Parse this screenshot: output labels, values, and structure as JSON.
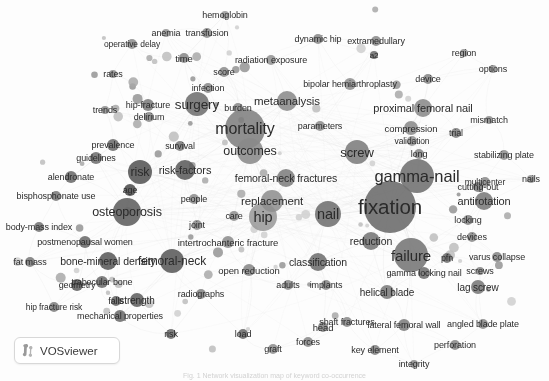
{
  "app": {
    "name": "VOSviewer",
    "logo_label": "VOSviewer",
    "logo_icon": "vosviewer-mark-icon",
    "view_type": "network-visualization",
    "background_color": "#fdfdfd",
    "node_color": "#6e6e6e",
    "link_color": "#c9c9c9",
    "label_color": "#2b2b2b",
    "canvas_width": 549,
    "canvas_height": 381
  },
  "caption": {
    "text": "Fig. 1 Network visualization map of keyword co-occurrence"
  },
  "chart_data": {
    "type": "scatter",
    "subtitle": "VOSviewer network visualization, grayscale",
    "xlabel": "",
    "ylabel": "",
    "legend": "none",
    "grid": false,
    "xlim": [
      0,
      549
    ],
    "ylim": [
      0,
      381
    ],
    "encoding": {
      "x": "map x position (px)",
      "y": "map y position (px)",
      "size": "node weight / occurrences (radius px)",
      "fontsize": "label weight (px)"
    },
    "nodes": [
      {
        "label": "fixation",
        "x": 390,
        "y": 207,
        "r": 26,
        "font": 20.5,
        "shade": "#6a6a6a"
      },
      {
        "label": "gamma-nail",
        "x": 417,
        "y": 176,
        "r": 17,
        "font": 16.5,
        "shade": "#6f6f6f"
      },
      {
        "label": "mortality",
        "x": 245,
        "y": 129,
        "r": 20,
        "font": 16,
        "shade": "#808080"
      },
      {
        "label": "failure",
        "x": 411,
        "y": 255,
        "r": 17,
        "font": 15,
        "shade": "#757575"
      },
      {
        "label": "nail",
        "x": 328,
        "y": 214,
        "r": 13,
        "font": 14.5,
        "shade": "#6f6f6f"
      },
      {
        "label": "hip",
        "x": 263,
        "y": 217,
        "r": 14,
        "font": 14.5,
        "shade": "#9a9a9a"
      },
      {
        "label": "surgery",
        "x": 197,
        "y": 104,
        "r": 12,
        "font": 13.5,
        "shade": "#707070"
      },
      {
        "label": "screw",
        "x": 357,
        "y": 152,
        "r": 12,
        "font": 13,
        "shade": "#7c7c7c"
      },
      {
        "label": "outcomes",
        "x": 250,
        "y": 151,
        "r": 13,
        "font": 12.5,
        "shade": "#8a8a8a"
      },
      {
        "label": "osteoporosis",
        "x": 127,
        "y": 212,
        "r": 14,
        "font": 12.5,
        "shade": "#5e5e5e"
      },
      {
        "label": "risk",
        "x": 140,
        "y": 172,
        "r": 12,
        "font": 12.5,
        "shade": "#555555"
      },
      {
        "label": "femoral-neck",
        "x": 172,
        "y": 261,
        "r": 12,
        "font": 12,
        "shade": "#5a5a5a"
      },
      {
        "label": "replacement",
        "x": 272,
        "y": 201,
        "r": 11,
        "font": 11.5,
        "shade": "#8f8f8f"
      },
      {
        "label": "metaanalysis",
        "x": 287,
        "y": 101,
        "r": 10,
        "font": 11.5,
        "shade": "#8b8b8b"
      },
      {
        "label": "antirotation",
        "x": 484,
        "y": 201,
        "r": 9,
        "font": 11,
        "shade": "#7a7a7a"
      },
      {
        "label": "risk-factors",
        "x": 185,
        "y": 170,
        "r": 10,
        "font": 11,
        "shade": "#5c5c5c"
      },
      {
        "label": "proximal femoral nail",
        "x": 423,
        "y": 108,
        "r": 9,
        "font": 11,
        "shade": "#8a8a8a"
      },
      {
        "label": "femoral-neck fractures",
        "x": 286,
        "y": 178,
        "r": 9,
        "font": 10.5,
        "shade": "#7e7e7e"
      },
      {
        "label": "reduction",
        "x": 371,
        "y": 241,
        "r": 9,
        "font": 10.5,
        "shade": "#757575"
      },
      {
        "label": "classification",
        "x": 318,
        "y": 262,
        "r": 9,
        "font": 10.5,
        "shade": "#6e6e6e"
      },
      {
        "label": "bone-mineral density",
        "x": 108,
        "y": 261,
        "r": 9,
        "font": 10.5,
        "shade": "#5a5a5a"
      },
      {
        "label": "lag screw",
        "x": 478,
        "y": 287,
        "r": 7,
        "font": 10,
        "shade": "#777777"
      },
      {
        "label": "helical blade",
        "x": 387,
        "y": 292,
        "r": 7,
        "font": 10,
        "shade": "#7b7b7b"
      },
      {
        "label": "strength",
        "x": 137,
        "y": 300,
        "r": 7,
        "font": 10,
        "shade": "#606060"
      },
      {
        "label": "compression",
        "x": 411,
        "y": 128,
        "r": 7,
        "font": 9.5,
        "shade": "#8b8b8b"
      },
      {
        "label": "open reduction",
        "x": 249,
        "y": 270,
        "r": 6,
        "font": 9.5,
        "shade": "#888888"
      },
      {
        "label": "intertrochanteric fracture",
        "x": 228,
        "y": 242,
        "r": 6,
        "font": 9.5,
        "shade": "#8d8d8d"
      },
      {
        "label": "gamma locking nail",
        "x": 424,
        "y": 273,
        "r": 6,
        "font": 9,
        "shade": "#6f6f6f"
      },
      {
        "label": "lateral femoral wall",
        "x": 404,
        "y": 325,
        "r": 6,
        "font": 9,
        "shade": "#7d7d7d"
      },
      {
        "label": "angled blade plate",
        "x": 483,
        "y": 324,
        "r": 5,
        "font": 9,
        "shade": "#8c8c8c"
      },
      {
        "label": "trabecular bone",
        "x": 102,
        "y": 282,
        "r": 6,
        "font": 9,
        "shade": "#6d6d6d"
      },
      {
        "label": "postmenopausal women",
        "x": 85,
        "y": 242,
        "r": 6,
        "font": 9,
        "shade": "#6a6a6a"
      },
      {
        "label": "bipolar hemiarthroplasty",
        "x": 350,
        "y": 84,
        "r": 6,
        "font": 9,
        "shade": "#8f8f8f"
      },
      {
        "label": "mechanical properties",
        "x": 120,
        "y": 316,
        "r": 6,
        "font": 9,
        "shade": "#6c6c6c"
      },
      {
        "label": "stabilizing plate",
        "x": 504,
        "y": 155,
        "r": 5,
        "font": 9,
        "shade": "#909090"
      },
      {
        "label": "varus collapse",
        "x": 497,
        "y": 257,
        "r": 5,
        "font": 9,
        "shade": "#868686"
      },
      {
        "label": "hip-fracture",
        "x": 148,
        "y": 105,
        "r": 6,
        "font": 9,
        "shade": "#7c7c7c"
      },
      {
        "label": "bisphosphonate use",
        "x": 56,
        "y": 196,
        "r": 5,
        "font": 9,
        "shade": "#7a7a7a"
      },
      {
        "label": "radiation exposure",
        "x": 271,
        "y": 60,
        "r": 5,
        "font": 9,
        "shade": "#949494"
      },
      {
        "label": "extramedullary",
        "x": 376,
        "y": 41,
        "r": 5,
        "font": 9,
        "shade": "#8b8b8b"
      },
      {
        "label": "body-mass index",
        "x": 39,
        "y": 227,
        "r": 5,
        "font": 9,
        "shade": "#757575"
      },
      {
        "label": "hip fracture risk",
        "x": 54,
        "y": 307,
        "r": 5,
        "font": 8.5,
        "shade": "#7f7f7f"
      },
      {
        "label": "operative delay",
        "x": 132,
        "y": 44,
        "r": 5,
        "font": 8.5,
        "shade": "#8e8e8e"
      },
      {
        "label": "dynamic hip",
        "x": 318,
        "y": 39,
        "r": 5,
        "font": 9,
        "shade": "#8a8a8a"
      },
      {
        "label": "multicenter",
        "x": 485,
        "y": 182,
        "r": 5,
        "font": 8.5,
        "shade": "#8b8b8b"
      },
      {
        "label": "shaft fractures",
        "x": 347,
        "y": 322,
        "r": 5,
        "font": 9,
        "shade": "#8a8a8a"
      },
      {
        "label": "key element",
        "x": 375,
        "y": 350,
        "r": 5,
        "font": 9,
        "shade": "#828282"
      },
      {
        "label": "perforation",
        "x": 455,
        "y": 345,
        "r": 5,
        "font": 9,
        "shade": "#898989"
      },
      {
        "label": "prevalence",
        "x": 113,
        "y": 145,
        "r": 6,
        "font": 9,
        "shade": "#6b6b6b"
      },
      {
        "label": "alendronate",
        "x": 71,
        "y": 177,
        "r": 6,
        "font": 9,
        "shade": "#6a6a6a"
      },
      {
        "label": "guidelines",
        "x": 96,
        "y": 158,
        "r": 6,
        "font": 9,
        "shade": "#707070"
      },
      {
        "label": "transfusion",
        "x": 207,
        "y": 33,
        "r": 5,
        "font": 9,
        "shade": "#8c8c8c"
      },
      {
        "label": "hemoglobin",
        "x": 225,
        "y": 15,
        "r": 4,
        "font": 9,
        "shade": "#9a9a9a"
      },
      {
        "label": "geometry",
        "x": 77,
        "y": 285,
        "r": 6,
        "font": 9,
        "shade": "#606060"
      },
      {
        "label": "radiographs",
        "x": 201,
        "y": 294,
        "r": 5,
        "font": 9,
        "shade": "#858585"
      },
      {
        "label": "implants",
        "x": 326,
        "y": 285,
        "r": 5,
        "font": 9,
        "shade": "#888888"
      },
      {
        "label": "cutting-out",
        "x": 478,
        "y": 187,
        "r": 5,
        "font": 9,
        "shade": "#7a7a7a"
      },
      {
        "label": "validation",
        "x": 412,
        "y": 141,
        "r": 5,
        "font": 8.5,
        "shade": "#949494"
      },
      {
        "label": "parameters",
        "x": 320,
        "y": 126,
        "r": 5,
        "font": 9,
        "shade": "#8e8e8e"
      },
      {
        "label": "survival",
        "x": 180,
        "y": 146,
        "r": 5,
        "font": 9,
        "shade": "#7a7a7a"
      },
      {
        "label": "infection",
        "x": 208,
        "y": 88,
        "r": 5,
        "font": 9,
        "shade": "#8b8b8b"
      },
      {
        "label": "burden",
        "x": 238,
        "y": 108,
        "r": 5,
        "font": 9,
        "shade": "#8b8b8b"
      },
      {
        "label": "delirium",
        "x": 149,
        "y": 117,
        "r": 5,
        "font": 9,
        "shade": "#8a8a8a"
      },
      {
        "label": "mismatch",
        "x": 489,
        "y": 120,
        "r": 4,
        "font": 9,
        "shade": "#909090"
      },
      {
        "label": "options",
        "x": 493,
        "y": 69,
        "r": 4,
        "font": 9,
        "shade": "#949494"
      },
      {
        "label": "region",
        "x": 464,
        "y": 53,
        "r": 4,
        "font": 9,
        "shade": "#949494"
      },
      {
        "label": "device",
        "x": 428,
        "y": 79,
        "r": 5,
        "font": 9,
        "shade": "#878787"
      },
      {
        "label": "trial",
        "x": 456,
        "y": 133,
        "r": 5,
        "font": 9,
        "shade": "#7f7f7f"
      },
      {
        "label": "long",
        "x": 419,
        "y": 154,
        "r": 5,
        "font": 9,
        "shade": "#8a8a8a"
      },
      {
        "label": "locking",
        "x": 468,
        "y": 220,
        "r": 5,
        "font": 9,
        "shade": "#848484"
      },
      {
        "label": "devices",
        "x": 472,
        "y": 237,
        "r": 5,
        "font": 9,
        "shade": "#8a8a8a"
      },
      {
        "label": "screws",
        "x": 480,
        "y": 271,
        "r": 4,
        "font": 9,
        "shade": "#868686"
      },
      {
        "label": "pfn",
        "x": 447,
        "y": 258,
        "r": 5,
        "font": 9,
        "shade": "#6f6f6f"
      },
      {
        "label": "nails",
        "x": 531,
        "y": 179,
        "r": 4,
        "font": 9,
        "shade": "#969696"
      },
      {
        "label": "anemia",
        "x": 166,
        "y": 33,
        "r": 4,
        "font": 9,
        "shade": "#959595"
      },
      {
        "label": "time",
        "x": 184,
        "y": 58,
        "r": 5,
        "font": 9.5,
        "shade": "#8a8a8a"
      },
      {
        "label": "score",
        "x": 224,
        "y": 72,
        "r": 5,
        "font": 9,
        "shade": "#8d8d8d"
      },
      {
        "label": "rates",
        "x": 113,
        "y": 74,
        "r": 4,
        "font": 9,
        "shade": "#8f8f8f"
      },
      {
        "label": "trends",
        "x": 105,
        "y": 110,
        "r": 4,
        "font": 9,
        "shade": "#8f8f8f"
      },
      {
        "label": "fat mass",
        "x": 30,
        "y": 262,
        "r": 5,
        "font": 9,
        "shade": "#7b7b7b"
      },
      {
        "label": "age",
        "x": 130,
        "y": 190,
        "r": 6,
        "font": 9,
        "shade": "#4d4d4d"
      },
      {
        "label": "people",
        "x": 194,
        "y": 199,
        "r": 5,
        "font": 9,
        "shade": "#8d8d8d"
      },
      {
        "label": "care",
        "x": 234,
        "y": 216,
        "r": 5,
        "font": 9,
        "shade": "#919191"
      },
      {
        "label": "joint",
        "x": 197,
        "y": 225,
        "r": 5,
        "font": 9,
        "shade": "#8b8b8b"
      },
      {
        "label": "falls",
        "x": 116,
        "y": 301,
        "r": 5,
        "font": 9,
        "shade": "#656565"
      },
      {
        "label": "adults",
        "x": 288,
        "y": 285,
        "r": 5,
        "font": 9,
        "shade": "#8c8c8c"
      },
      {
        "label": "head",
        "x": 323,
        "y": 327,
        "r": 5,
        "font": 9.5,
        "shade": "#838383"
      },
      {
        "label": "forces",
        "x": 308,
        "y": 342,
        "r": 5,
        "font": 9,
        "shade": "#8b8b8b"
      },
      {
        "label": "graft",
        "x": 273,
        "y": 349,
        "r": 5,
        "font": 9,
        "shade": "#8f8f8f"
      },
      {
        "label": "load",
        "x": 243,
        "y": 334,
        "r": 5,
        "font": 9,
        "shade": "#6b6b6b"
      },
      {
        "label": "risk",
        "x": 171,
        "y": 334,
        "r": 5,
        "font": 9,
        "shade": "#6d6d6d"
      },
      {
        "label": "integrity",
        "x": 414,
        "y": 364,
        "r": 4,
        "font": 9,
        "shade": "#8c8c8c"
      },
      {
        "label": "a2",
        "x": 374,
        "y": 55,
        "r": 4,
        "font": 8,
        "shade": "#6e6e6e"
      }
    ],
    "node_count": 95,
    "link_count": 430,
    "clusters": [
      {
        "name": "implant-fixation",
        "representative": [
          "fixation",
          "gamma-nail",
          "screw",
          "failure",
          "nail"
        ]
      },
      {
        "name": "outcomes-mortality",
        "representative": [
          "mortality",
          "outcomes",
          "surgery",
          "metaanalysis"
        ]
      },
      {
        "name": "bone-density-osteoporosis",
        "representative": [
          "osteoporosis",
          "bone-mineral density",
          "femoral-neck",
          "risk"
        ]
      }
    ]
  }
}
